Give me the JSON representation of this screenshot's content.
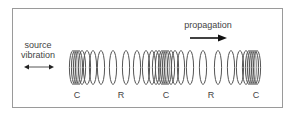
{
  "diagram": {
    "source_label_line1": "source",
    "source_label_line2": "vibration",
    "propagation_label": "propagation",
    "zones": [
      {
        "label": "C",
        "x": 77
      },
      {
        "label": "R",
        "x": 121
      },
      {
        "label": "C",
        "x": 166
      },
      {
        "label": "R",
        "x": 211
      },
      {
        "label": "C",
        "x": 256
      }
    ],
    "ring_color": "#555555",
    "compressed_fill": "#d8d8d8",
    "ring_positions": [
      73,
      75,
      77,
      79,
      82,
      87,
      93,
      101,
      113,
      126,
      137,
      146,
      152,
      156,
      159,
      162,
      164,
      166,
      168,
      171,
      175,
      181,
      190,
      203,
      218,
      231,
      240,
      246,
      249,
      251,
      253,
      255,
      257
    ]
  }
}
